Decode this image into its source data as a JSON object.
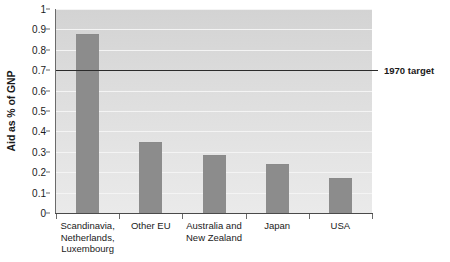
{
  "chart_data": {
    "type": "bar",
    "title": "",
    "xlabel": "",
    "ylabel": "Aid as % of GNP",
    "categories": [
      "Scandinavia, Netherlands, Luxembourg",
      "Other EU",
      "Australia and New Zealand",
      "Japan",
      "USA"
    ],
    "category_lines": [
      [
        "Scandinavia,",
        "Netherlands,",
        "Luxembourg"
      ],
      [
        "Other EU"
      ],
      [
        "Australia and",
        "New Zealand"
      ],
      [
        "Japan"
      ],
      [
        "USA"
      ]
    ],
    "values": [
      0.875,
      0.345,
      0.28,
      0.235,
      0.165
    ],
    "ylim": [
      0,
      1
    ],
    "ytick_labels": [
      "0",
      "0.1",
      "0.2",
      "0.3",
      "0.4",
      "0.5",
      "0.6",
      "0.7",
      "0.8",
      "0.9",
      "1"
    ],
    "ytick_values": [
      0,
      0.1,
      0.2,
      0.3,
      0.4,
      0.5,
      0.6,
      0.7,
      0.8,
      0.9,
      1
    ],
    "grid": true,
    "legend": "none",
    "annotations": [
      {
        "label": "1970 target",
        "value": 0.7,
        "type": "horizontal-line"
      }
    ],
    "colors": {
      "bar": "#8c8c8c",
      "plot_background": "#dcdcdc",
      "gridline": "#f4f4f4",
      "target_line": "#2b2b2b",
      "axis": "#6b6b6b",
      "text": "#1a1a1a"
    }
  }
}
